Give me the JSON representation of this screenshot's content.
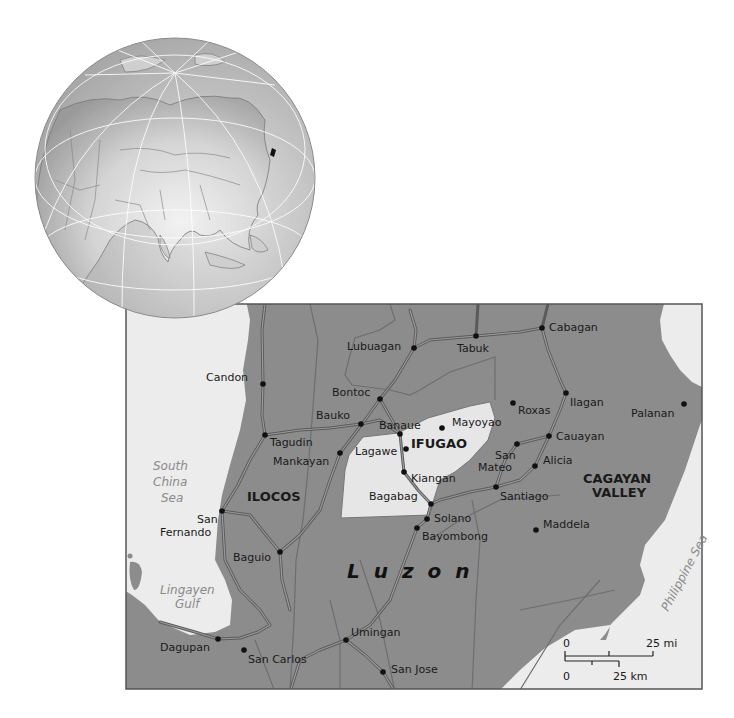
{
  "colors": {
    "land": "#8c8c8c",
    "water": "#ececec",
    "highlight_region": "#e6e6e6",
    "roads": "#6a6a6a",
    "river_outline": "#5e5e5e",
    "globe_land": "#cfcfcf",
    "globe_water": "#b0b0b0",
    "frame": "#555555",
    "text": "#1a1a1a",
    "water_text": "#8a8a8a"
  },
  "locator_globe": {
    "description": "Orthographic globe centered on Asia with highlighted area marking the Philippines",
    "highlight_marker": "Philippines"
  },
  "map": {
    "region_labels": [
      {
        "id": "ifugao",
        "text": "IFUGAO",
        "x": 411,
        "y": 448
      },
      {
        "id": "ilocos",
        "text": "ILOCOS",
        "x": 247,
        "y": 501
      },
      {
        "id": "cagayan-valley-1",
        "text": "CAGAYAN",
        "x": 583,
        "y": 483
      },
      {
        "id": "cagayan-valley-2",
        "text": "VALLEY",
        "x": 592,
        "y": 497
      }
    ],
    "island_label": {
      "text": "Luzon",
      "x": 347,
      "y": 578
    },
    "water_labels": [
      {
        "id": "south-china-sea-1",
        "text": "South",
        "x": 153,
        "y": 470
      },
      {
        "id": "south-china-sea-2",
        "text": "China",
        "x": 153,
        "y": 486
      },
      {
        "id": "south-china-sea-3",
        "text": "Sea",
        "x": 161,
        "y": 502
      },
      {
        "id": "lingayen-gulf-1",
        "text": "Lingayen",
        "x": 160,
        "y": 594
      },
      {
        "id": "lingayen-gulf-2",
        "text": "Gulf",
        "x": 175,
        "y": 608
      }
    ],
    "rotated_water_label": {
      "text": "Philippine Sea",
      "x": 668,
      "y": 612,
      "angle": -62
    },
    "cities": [
      {
        "name": "Lubuagan",
        "dot": [
          414,
          348
        ],
        "label": [
          347,
          350
        ]
      },
      {
        "name": "Tabuk",
        "dot": [
          476,
          336
        ],
        "label": [
          457,
          352
        ]
      },
      {
        "name": "Cabagan",
        "dot": [
          542,
          328
        ],
        "label": [
          549,
          331
        ]
      },
      {
        "name": "Candon",
        "dot": [
          263,
          384
        ],
        "label": [
          206,
          381
        ]
      },
      {
        "name": "Bontoc",
        "dot": [
          380,
          399
        ],
        "label": [
          332,
          396
        ]
      },
      {
        "name": "Bauko",
        "dot": [
          361,
          424
        ],
        "label": [
          316,
          419
        ]
      },
      {
        "name": "Tagudin",
        "dot": [
          265,
          435
        ],
        "label": [
          270,
          446
        ]
      },
      {
        "name": "Banaue",
        "dot": [
          400,
          434
        ],
        "label": [
          379,
          429
        ]
      },
      {
        "name": "Mayoyao",
        "dot": [
          442,
          428
        ],
        "label": [
          452,
          426
        ]
      },
      {
        "name": "Roxas",
        "dot": [
          513,
          403
        ],
        "label": [
          518,
          414
        ]
      },
      {
        "name": "Ilagan",
        "dot": [
          566,
          393
        ],
        "label": [
          570,
          406
        ]
      },
      {
        "name": "Palanan",
        "dot": [
          684,
          404
        ],
        "label": [
          631,
          417
        ]
      },
      {
        "name": "Mankayan",
        "dot": [
          340,
          453
        ],
        "label": [
          273,
          465
        ]
      },
      {
        "name": "Lagawe",
        "dot": [
          406,
          449
        ],
        "label": [
          355,
          455
        ]
      },
      {
        "name": "Kiangan",
        "dot": [
          404,
          472
        ],
        "label": [
          411,
          482
        ]
      },
      {
        "name": "San",
        "dot": [
          517,
          444
        ],
        "label": [
          495,
          459
        ]
      },
      {
        "name": "Mateo",
        "dot": null,
        "label": [
          478,
          471
        ]
      },
      {
        "name": "Cauayan",
        "dot": [
          549,
          436
        ],
        "label": [
          556,
          440
        ]
      },
      {
        "name": "Alicia",
        "dot": [
          535,
          466
        ],
        "label": [
          543,
          464
        ]
      },
      {
        "name": "Santiago",
        "dot": [
          496,
          487
        ],
        "label": [
          500,
          500
        ]
      },
      {
        "name": "Bagabag",
        "dot": [
          431,
          504
        ],
        "label": [
          369,
          500
        ]
      },
      {
        "name": "San",
        "dot": [
          222,
          511
        ],
        "label": [
          197,
          523
        ]
      },
      {
        "name": "Fernando",
        "dot": null,
        "label": [
          160,
          536
        ]
      },
      {
        "name": "Solano",
        "dot": [
          427,
          519
        ],
        "label": [
          434,
          522
        ]
      },
      {
        "name": "Bayombong",
        "dot": [
          417,
          528
        ],
        "label": [
          422,
          540
        ]
      },
      {
        "name": "Maddela",
        "dot": [
          536,
          530
        ],
        "label": [
          543,
          528
        ]
      },
      {
        "name": "Baguio",
        "dot": [
          280,
          552
        ],
        "label": [
          233,
          561
        ]
      },
      {
        "name": "Umingan",
        "dot": [
          346,
          640
        ],
        "label": [
          351,
          636
        ]
      },
      {
        "name": "Dagupan",
        "dot": [
          218,
          639
        ],
        "label": [
          160,
          651
        ]
      },
      {
        "name": "San Carlos",
        "dot": [
          244,
          650
        ],
        "label": [
          248,
          663
        ]
      },
      {
        "name": "San Jose",
        "dot": [
          383,
          672
        ],
        "label": [
          391,
          673
        ]
      }
    ],
    "scale_bar": {
      "miles_zero": "0",
      "miles_label": "25 mi",
      "km_zero": "0",
      "km_label": "25 km"
    }
  }
}
